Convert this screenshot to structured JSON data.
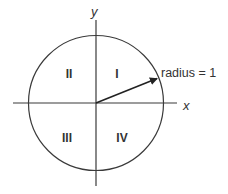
{
  "diagram": {
    "axes": {
      "x_label": "x",
      "y_label": "y"
    },
    "quadrants": [
      {
        "id": "I",
        "label": "I"
      },
      {
        "id": "II",
        "label": "II"
      },
      {
        "id": "III",
        "label": "III"
      },
      {
        "id": "IV",
        "label": "IV"
      }
    ],
    "radius_label": "radius = 1",
    "colors": {
      "stroke": "#3a3a3a",
      "text": "#333333",
      "background": "#ffffff"
    }
  }
}
